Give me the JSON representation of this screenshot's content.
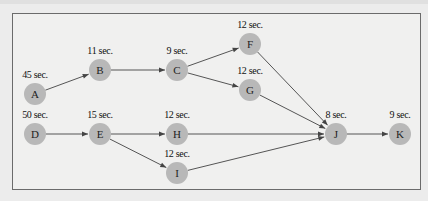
{
  "diagram": {
    "type": "precedence-network",
    "node_color": "#b8b8b8",
    "edge_color": "#555555",
    "nodes": [
      {
        "id": "A",
        "label": "A",
        "time": "45 sec.",
        "x": 35,
        "y": 94
      },
      {
        "id": "B",
        "label": "B",
        "time": "11 sec.",
        "x": 100,
        "y": 70
      },
      {
        "id": "C",
        "label": "C",
        "time": "9 sec.",
        "x": 177,
        "y": 70
      },
      {
        "id": "F",
        "label": "F",
        "time": "12 sec.",
        "x": 250,
        "y": 44
      },
      {
        "id": "G",
        "label": "G",
        "time": "12 sec.",
        "x": 250,
        "y": 90
      },
      {
        "id": "D",
        "label": "D",
        "time": "50 sec.",
        "x": 35,
        "y": 134
      },
      {
        "id": "E",
        "label": "E",
        "time": "15 sec.",
        "x": 100,
        "y": 134
      },
      {
        "id": "H",
        "label": "H",
        "time": "12 sec.",
        "x": 177,
        "y": 134
      },
      {
        "id": "I",
        "label": "I",
        "time": "12 sec.",
        "x": 177,
        "y": 173
      },
      {
        "id": "J",
        "label": "J",
        "time": "8 sec.",
        "x": 336,
        "y": 134
      },
      {
        "id": "K",
        "label": "K",
        "time": "9 sec.",
        "x": 400,
        "y": 134
      }
    ],
    "edges": [
      {
        "from": "A",
        "to": "B"
      },
      {
        "from": "B",
        "to": "C"
      },
      {
        "from": "C",
        "to": "F"
      },
      {
        "from": "C",
        "to": "G"
      },
      {
        "from": "F",
        "to": "J"
      },
      {
        "from": "G",
        "to": "J"
      },
      {
        "from": "D",
        "to": "E"
      },
      {
        "from": "E",
        "to": "H"
      },
      {
        "from": "E",
        "to": "I"
      },
      {
        "from": "H",
        "to": "J"
      },
      {
        "from": "I",
        "to": "J"
      },
      {
        "from": "J",
        "to": "K"
      }
    ]
  }
}
